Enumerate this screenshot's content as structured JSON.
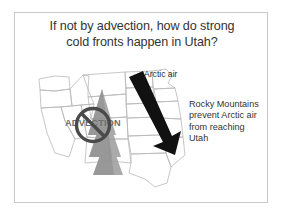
{
  "slide": {
    "title": {
      "lines": [
        "If not by advection, how do strong",
        "cold fronts happen in Utah?"
      ]
    },
    "labels": {
      "arctic_air": "Arctic air",
      "advection": "ADVECTION"
    },
    "explanation": {
      "lines": [
        "Rocky Mountains",
        "prevent Arctic air",
        "from reaching",
        "Utah"
      ]
    },
    "colors": {
      "title_text": "#333333",
      "body_text": "#333333",
      "advection_text": "#6f6f6f",
      "no_symbol": "#4a4a4a",
      "arrow": "#111111",
      "mountains": "#9c9c9c",
      "map_outline": "#b9b9b9",
      "frame_border": "#c9c9c9",
      "background": "#ffffff"
    },
    "graphics": {
      "arctic_air_arrow": "large-black-arrow-pointing-down-right",
      "mountain_range": "stacked-gray-triangles-rocky-mountains",
      "prohibition_sign": "circle-with-diagonal-slash",
      "basemap": "western-united-states-state-outlines"
    }
  }
}
